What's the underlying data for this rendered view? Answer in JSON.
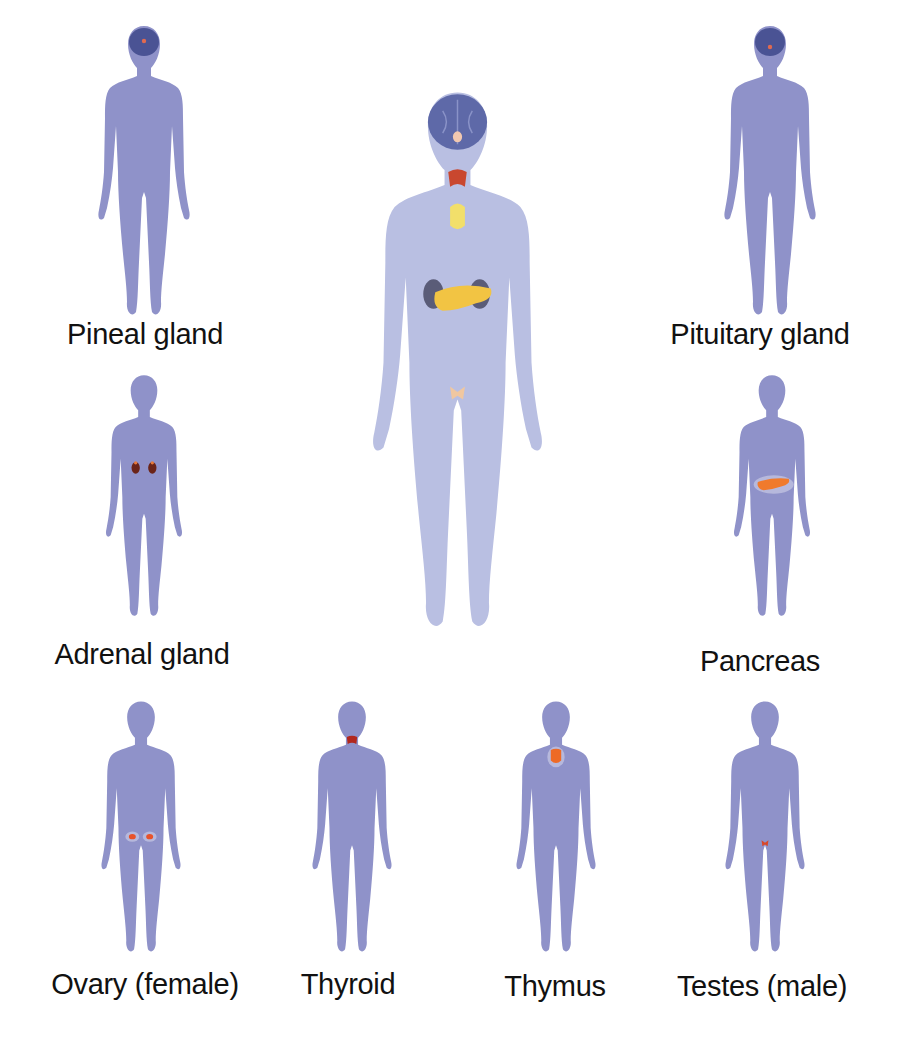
{
  "diagram": {
    "body_color": "#8f92c9",
    "main_body_color": "#b9bfe2",
    "central_figure": {
      "organs": [
        "pineal/pituitary (brain)",
        "thyroid",
        "thymus",
        "adrenal glands",
        "pancreas",
        "gonads"
      ]
    },
    "panels": [
      {
        "id": "pineal",
        "label": "Pineal gland",
        "organ_color": "#e06a50"
      },
      {
        "id": "pituitary",
        "label": "Pituitary gland",
        "organ_color": "#e06a50"
      },
      {
        "id": "adrenal",
        "label": "Adrenal gland",
        "organ_color": "#6b2418"
      },
      {
        "id": "pancreas",
        "label": "Pancreas",
        "organ_color": "#f07a2c"
      },
      {
        "id": "ovary",
        "label": "Ovary (female)",
        "organ_color": "#e8522a"
      },
      {
        "id": "thyroid",
        "label": "Thyroid",
        "organ_color": "#b2281e"
      },
      {
        "id": "thymus",
        "label": "Thymus",
        "organ_color": "#ee6a26"
      },
      {
        "id": "testes",
        "label": "Testes (male)",
        "organ_color": "#d8482a"
      }
    ]
  }
}
